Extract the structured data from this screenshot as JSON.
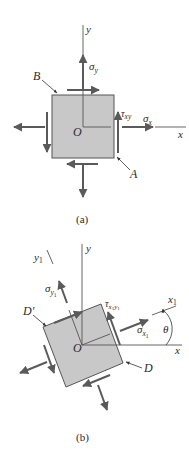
{
  "figure": {
    "colors": {
      "element_fill": "#c8c8c8",
      "arrow": "#5a5a5a",
      "axis": "#555555",
      "text": "#2a2a2a"
    },
    "panel_a": {
      "caption": "(a)",
      "labels": {
        "y_axis": "y",
        "x_axis": "x",
        "origin": "O",
        "sigma_y": "σ",
        "sigma_y_sub": "y",
        "sigma_x": "σ",
        "sigma_x_sub": "x",
        "tau": "τ",
        "tau_sub": "xy",
        "point_b": "B",
        "point_a": "A"
      }
    },
    "panel_b": {
      "caption": "(b)",
      "labels": {
        "y_axis": "y",
        "x_axis": "x",
        "y1_axis": "y",
        "y1_sub": "1",
        "x1_axis": "x",
        "x1_sub": "1",
        "origin": "O",
        "sigma_y1": "σ",
        "sigma_y1_sub": "y",
        "sigma_y1_subsub": "1",
        "sigma_x1": "σ",
        "sigma_x1_sub": "x",
        "sigma_x1_subsub": "1",
        "tau": "τ",
        "tau_sub": "x",
        "tau_sub_1": "1",
        "tau_sub2": "y",
        "tau_sub2_1": "1",
        "theta": "θ",
        "point_d_prime": "D′",
        "point_d": "D"
      }
    }
  }
}
